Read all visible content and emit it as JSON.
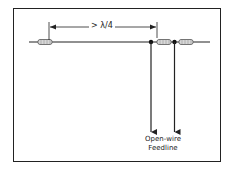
{
  "diagram": {
    "dimension_label": "> λ/4",
    "feedline_label_line1": "Open-wire",
    "feedline_label_line2": "Feedline",
    "colors": {
      "line": "#222222",
      "background": "#ffffff",
      "insulator_fill": "#d8d8d8"
    },
    "elements": [
      {
        "type": "wire",
        "description": "antenna wire",
        "from": [
          29,
          42
        ],
        "to": [
          210,
          42
        ]
      },
      {
        "type": "insulator",
        "position": "left end",
        "x": 38
      },
      {
        "type": "insulator",
        "position": "center",
        "x": 157
      },
      {
        "type": "insulator",
        "position": "right end",
        "x": 178
      },
      {
        "type": "junction",
        "x": 151
      },
      {
        "type": "junction",
        "x": 174
      },
      {
        "type": "feedline-conductor",
        "from_x": 151,
        "arrow": "down"
      },
      {
        "type": "feedline-conductor",
        "from_x": 174,
        "arrow": "down"
      },
      {
        "type": "dimension",
        "from_x": 45,
        "to_x": 151,
        "label": "> λ/4"
      }
    ]
  }
}
